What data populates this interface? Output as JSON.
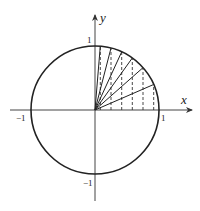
{
  "diagram": {
    "axes": {
      "x_label": "x",
      "y_label": "y",
      "tick_labels": {
        "x_pos": "1",
        "x_neg": "−1",
        "y_pos": "1",
        "y_neg": "−1"
      }
    },
    "circle": {
      "radius": 1
    },
    "projection_x_values": [
      0.083,
      0.25,
      0.417,
      0.583,
      0.75,
      0.917
    ],
    "colors": {
      "stroke": "#222222",
      "background": "#ffffff"
    }
  }
}
